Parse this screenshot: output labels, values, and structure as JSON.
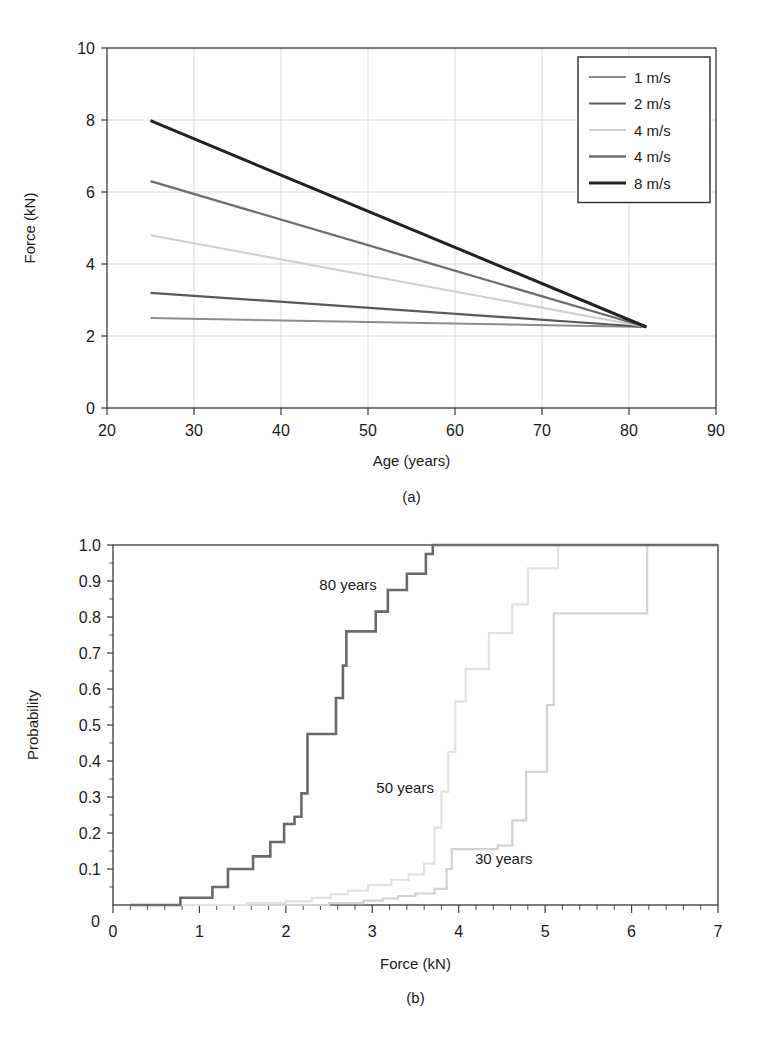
{
  "figure": {
    "panels": [
      {
        "caption": "(a)"
      },
      {
        "caption": "(b)"
      }
    ]
  },
  "chart_data": [
    {
      "panel": "a",
      "type": "line",
      "title": "",
      "xlabel": "Age (years)",
      "ylabel": "Force (kN)",
      "xlim": [
        20,
        90
      ],
      "ylim": [
        0,
        10
      ],
      "xticks": [
        20,
        30,
        40,
        50,
        60,
        70,
        80,
        90
      ],
      "yticks": [
        0,
        2,
        4,
        6,
        8,
        10
      ],
      "xtick_labels": [
        "20",
        "30",
        "40",
        "50",
        "60",
        "70",
        "80",
        "90"
      ],
      "ytick_labels": [
        "0",
        "2",
        "4",
        "6",
        "8",
        "10"
      ],
      "grid": true,
      "legend_position": "top-right",
      "series": [
        {
          "name": "1 m/s",
          "color": "#8c8c8c",
          "width": 2.0,
          "x": [
            25,
            82
          ],
          "y": [
            2.5,
            2.25
          ]
        },
        {
          "name": "2 m/s",
          "color": "#5a5a5a",
          "width": 2.2,
          "x": [
            25,
            82
          ],
          "y": [
            3.2,
            2.25
          ]
        },
        {
          "name": "4 m/s",
          "color": "#cfcfcf",
          "width": 2.0,
          "x": [
            25,
            82
          ],
          "y": [
            4.8,
            2.25
          ]
        },
        {
          "name": "4 m/s",
          "color": "#6e6e6e",
          "width": 2.3,
          "x": [
            25,
            82
          ],
          "y": [
            6.3,
            2.25
          ]
        },
        {
          "name": "8 m/s",
          "color": "#222222",
          "width": 3.0,
          "x": [
            25,
            82
          ],
          "y": [
            7.98,
            2.25
          ]
        }
      ]
    },
    {
      "panel": "b",
      "type": "line",
      "title": "",
      "xlabel": "Force (kN)",
      "ylabel": "Probability",
      "xlim": [
        0,
        7
      ],
      "ylim": [
        0,
        1.0
      ],
      "xticks": [
        0,
        1,
        2,
        3,
        4,
        5,
        6,
        7
      ],
      "yticks": [
        0,
        0.1,
        0.2,
        0.3,
        0.4,
        0.5,
        0.6,
        0.7,
        0.8,
        0.9,
        1.0
      ],
      "xtick_labels": [
        "0",
        "1",
        "2",
        "3",
        "4",
        "5",
        "6",
        "7"
      ],
      "ytick_labels": [
        "0",
        "0.1",
        "0.2",
        "0.3",
        "0.4",
        "0.5",
        "0.6",
        "0.7",
        "0.8",
        "0.9",
        "1.0"
      ],
      "grid": false,
      "legend_position": "inline-annotations",
      "annotations": [
        {
          "text": "80 years",
          "x": 2.72,
          "y": 0.875
        },
        {
          "text": "50 years",
          "x": 3.38,
          "y": 0.31
        },
        {
          "text": "30 years",
          "x": 4.52,
          "y": 0.115
        }
      ],
      "series": [
        {
          "name": "80 years",
          "color": "#6a6a6a",
          "width": 2.6,
          "drawstyle": "steps-post",
          "x": [
            0.2,
            0.78,
            0.78,
            1.15,
            1.15,
            1.33,
            1.33,
            1.62,
            1.62,
            1.82,
            1.82,
            1.98,
            1.98,
            2.1,
            2.1,
            2.18,
            2.18,
            2.25,
            2.25,
            2.58,
            2.58,
            2.66,
            2.66,
            2.7,
            2.7,
            3.04,
            3.04,
            3.18,
            3.18,
            3.4,
            3.4,
            3.62,
            3.62,
            3.7,
            3.7,
            7.0
          ],
          "y": [
            0.0,
            0.0,
            0.02,
            0.02,
            0.05,
            0.05,
            0.1,
            0.1,
            0.135,
            0.135,
            0.175,
            0.175,
            0.225,
            0.225,
            0.245,
            0.245,
            0.31,
            0.31,
            0.475,
            0.475,
            0.575,
            0.575,
            0.665,
            0.665,
            0.76,
            0.76,
            0.815,
            0.815,
            0.875,
            0.875,
            0.92,
            0.92,
            0.975,
            0.975,
            1.0,
            1.0
          ]
        },
        {
          "name": "50 years",
          "color": "#e2e2e2",
          "width": 2.2,
          "drawstyle": "steps-post",
          "x": [
            0.2,
            1.55,
            1.55,
            2.0,
            2.0,
            2.3,
            2.3,
            2.52,
            2.52,
            2.72,
            2.72,
            2.95,
            2.95,
            3.22,
            3.22,
            3.42,
            3.42,
            3.6,
            3.6,
            3.72,
            3.72,
            3.8,
            3.8,
            3.88,
            3.88,
            3.96,
            3.96,
            4.08,
            4.08,
            4.35,
            4.35,
            4.62,
            4.62,
            4.8,
            4.8,
            5.15,
            5.15,
            7.0
          ],
          "y": [
            0.0,
            0.0,
            0.005,
            0.005,
            0.01,
            0.01,
            0.02,
            0.02,
            0.03,
            0.03,
            0.04,
            0.04,
            0.055,
            0.055,
            0.07,
            0.07,
            0.085,
            0.085,
            0.115,
            0.115,
            0.215,
            0.215,
            0.315,
            0.315,
            0.425,
            0.425,
            0.565,
            0.565,
            0.655,
            0.655,
            0.755,
            0.755,
            0.835,
            0.835,
            0.935,
            0.935,
            1.0,
            1.0
          ]
        },
        {
          "name": "30 years",
          "color": "#d2d2d2",
          "width": 2.2,
          "drawstyle": "steps-post",
          "x": [
            0.2,
            2.5,
            2.5,
            2.9,
            2.9,
            3.12,
            3.12,
            3.3,
            3.3,
            3.5,
            3.5,
            3.72,
            3.72,
            3.86,
            3.86,
            3.92,
            3.92,
            4.45,
            4.45,
            4.62,
            4.62,
            4.78,
            4.78,
            5.02,
            5.02,
            5.1,
            5.1,
            6.18,
            6.18,
            7.0
          ],
          "y": [
            0.0,
            0.0,
            0.005,
            0.005,
            0.012,
            0.012,
            0.018,
            0.018,
            0.025,
            0.025,
            0.032,
            0.032,
            0.045,
            0.045,
            0.1,
            0.1,
            0.155,
            0.155,
            0.165,
            0.165,
            0.235,
            0.235,
            0.37,
            0.37,
            0.555,
            0.555,
            0.81,
            0.81,
            1.0,
            1.0
          ]
        }
      ]
    }
  ]
}
